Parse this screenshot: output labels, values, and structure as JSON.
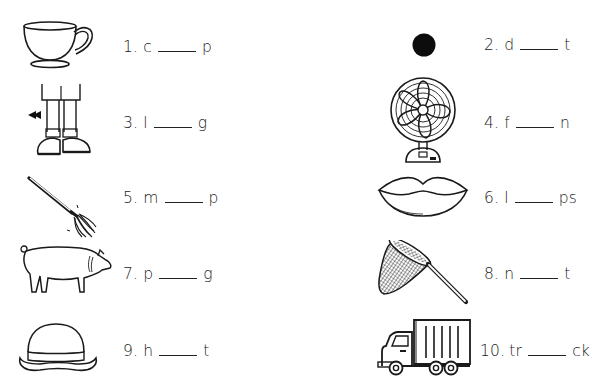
{
  "worksheet": {
    "items": [
      {
        "number": "1.",
        "prefix": "c",
        "suffix": "p",
        "picture": "teacup"
      },
      {
        "number": "2.",
        "prefix": "d",
        "suffix": "t",
        "picture": "dot"
      },
      {
        "number": "3.",
        "prefix": "l",
        "suffix": "g",
        "picture": "legs"
      },
      {
        "number": "4.",
        "prefix": "f",
        "suffix": "n",
        "picture": "fan"
      },
      {
        "number": "5.",
        "prefix": "m",
        "suffix": "p",
        "picture": "mop"
      },
      {
        "number": "6.",
        "prefix": "l",
        "suffix": "ps",
        "picture": "lips"
      },
      {
        "number": "7.",
        "prefix": "p",
        "suffix": "g",
        "picture": "pig"
      },
      {
        "number": "8.",
        "prefix": "n",
        "suffix": "t",
        "picture": "net"
      },
      {
        "number": "9.",
        "prefix": "h",
        "suffix": "t",
        "picture": "hat"
      },
      {
        "number": "10.",
        "prefix": "tr",
        "suffix": "ck",
        "picture": "truck"
      }
    ]
  },
  "colors": {
    "ink": "#1a1a1a",
    "background": "#ffffff"
  }
}
